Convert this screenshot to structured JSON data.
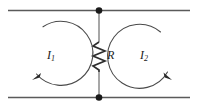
{
  "figure": {
    "name": "two-loop-circuit",
    "width": 199,
    "height": 111,
    "background_color": "#ffffff"
  },
  "components": {
    "resistor": {
      "label": "R",
      "icon": "resistor-zigzag-icon",
      "orientation": "vertical",
      "zigzag_peaks": 4,
      "color": "#2e2e2e"
    },
    "nodes": [
      {
        "name": "top-node",
        "label": "",
        "x": 99,
        "y": 10
      },
      {
        "name": "bottom-node",
        "label": "",
        "x": 99,
        "y": 97
      }
    ],
    "wires": [
      {
        "name": "top-wire",
        "x1": 8,
        "y1": 10,
        "x2": 190,
        "y2": 10,
        "color": "#5a5a5a"
      },
      {
        "name": "bottom-wire",
        "x1": 8,
        "y1": 97,
        "x2": 190,
        "y2": 97,
        "color": "#5a5a5a"
      },
      {
        "name": "resistor-branch",
        "x1": 99,
        "y1": 10,
        "x2": 99,
        "y2": 97,
        "color": "#8a8a8a"
      }
    ]
  },
  "loops": [
    {
      "name": "left-mesh",
      "label": "I",
      "subscript": "1",
      "direction": "counterclockwise",
      "arrow_icon": "loop-arrow-counterclockwise-icon",
      "center_x": 57,
      "center_y": 54,
      "radius": 32,
      "color": "#4a4a4a"
    },
    {
      "name": "right-mesh",
      "label": "I",
      "subscript": "2",
      "direction": "clockwise",
      "arrow_icon": "loop-arrow-clockwise-icon",
      "center_x": 145,
      "center_y": 54,
      "radius": 32,
      "color": "#4a4a4a"
    }
  ],
  "labels": {
    "resistor": "R",
    "current_left": "I",
    "current_left_sub": "1",
    "current_right": "I",
    "current_right_sub": "2"
  }
}
